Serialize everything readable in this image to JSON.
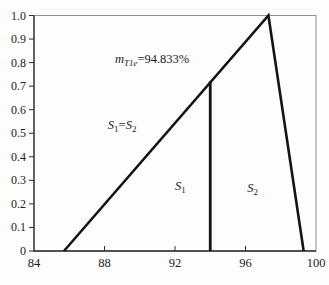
{
  "figure": {
    "background": "#fdfdfd",
    "colors": {
      "line": "#141414",
      "frame": "#8f8f8f",
      "axis": "#2e2e2e",
      "text": "#1c1c1c"
    }
  },
  "chart_data": {
    "type": "line",
    "title": "",
    "xlabel": "",
    "ylabel": "",
    "xlim": [
      84,
      100
    ],
    "ylim": [
      0,
      1
    ],
    "grid": false,
    "legend": false,
    "x_ticks": [
      84,
      88,
      92,
      96,
      100
    ],
    "x_tick_labels": [
      "84",
      "88",
      "92",
      "96",
      "100"
    ],
    "y_ticks": [
      0,
      0.1,
      0.2,
      0.3,
      0.4,
      0.5,
      0.6,
      0.7,
      0.8,
      0.9,
      1.0
    ],
    "y_tick_labels": [
      "0",
      "0.1",
      "0.2",
      "0.3",
      "0.4",
      "0.5",
      "0.6",
      "0.7",
      "0.8",
      "0.9",
      "1.0"
    ],
    "series": [
      {
        "name": "triangle-outline",
        "stroke_width": 2.6,
        "points": [
          [
            85.7,
            0
          ],
          [
            97.3,
            1.0
          ],
          [
            99.3,
            0
          ]
        ]
      },
      {
        "name": "s1-s2-divider-line",
        "stroke_width": 2.8,
        "points": [
          [
            94.0,
            0
          ],
          [
            94.0,
            0.72
          ]
        ]
      }
    ],
    "annotations": [
      {
        "name": "match-value-annotation",
        "x": 90.7,
        "y": 0.815,
        "text": "m_{T1e}=94.833%",
        "parts": [
          {
            "t": "m",
            "italic": true
          },
          {
            "t": "T1e",
            "italic": true,
            "sub": true
          },
          {
            "t": "=94.833%"
          }
        ]
      },
      {
        "name": "s1-equals-s2-label",
        "x": 89.0,
        "y": 0.535,
        "text": "S1=S2",
        "parts": [
          {
            "t": "S",
            "italic": true
          },
          {
            "t": "1",
            "sub": true
          },
          {
            "t": "="
          },
          {
            "t": "S",
            "italic": true
          },
          {
            "t": "2",
            "sub": true
          }
        ]
      },
      {
        "name": "s1-region-label",
        "x": 92.3,
        "y": 0.276,
        "text": "S1",
        "parts": [
          {
            "t": "S",
            "italic": true
          },
          {
            "t": "1",
            "sub": true
          }
        ]
      },
      {
        "name": "s2-region-label",
        "x": 96.4,
        "y": 0.267,
        "text": "S2",
        "parts": [
          {
            "t": "S",
            "italic": true
          },
          {
            "t": "2",
            "sub": true
          }
        ]
      }
    ]
  }
}
